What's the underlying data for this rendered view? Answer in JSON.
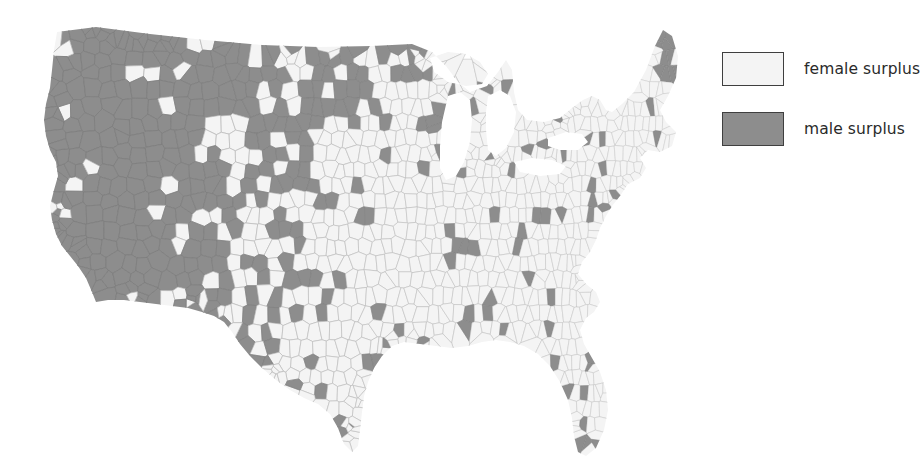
{
  "figure": {
    "type": "choropleth-map",
    "region": "United States",
    "unit": "county",
    "background_color": "#ffffff"
  },
  "legend": {
    "position": "right",
    "items": [
      {
        "label": "female surplus",
        "color": "#f4f4f4",
        "border": "#3f3f3f"
      },
      {
        "label": "male surplus",
        "color": "#8d8d8d",
        "border": "#3f3f3f"
      }
    ]
  },
  "chart_data": {
    "type": "map",
    "title": "",
    "subtitle": "",
    "xlabel": "",
    "ylabel": "",
    "legend_position": "right",
    "grid": false,
    "categories": [
      "female surplus",
      "male surplus"
    ],
    "colors": {
      "female_surplus": "#f4f4f4",
      "male_surplus": "#8d8d8d",
      "border": "#b9b9b9",
      "background": "#ffffff"
    },
    "projection": "albers-usa",
    "regional_summary": [
      {
        "region": "Mountain West",
        "dominant": "male surplus",
        "share_pct": 72
      },
      {
        "region": "Northern Plains",
        "dominant": "male surplus",
        "share_pct": 58
      },
      {
        "region": "Pacific Coast",
        "dominant": "mixed",
        "share_pct": 45
      },
      {
        "region": "Texas",
        "dominant": "female surplus",
        "share_pct": 28
      },
      {
        "region": "Midwest",
        "dominant": "female surplus",
        "share_pct": 14
      },
      {
        "region": "Southeast",
        "dominant": "female surplus",
        "share_pct": 11
      },
      {
        "region": "Northeast",
        "dominant": "female surplus",
        "share_pct": 8
      }
    ]
  }
}
